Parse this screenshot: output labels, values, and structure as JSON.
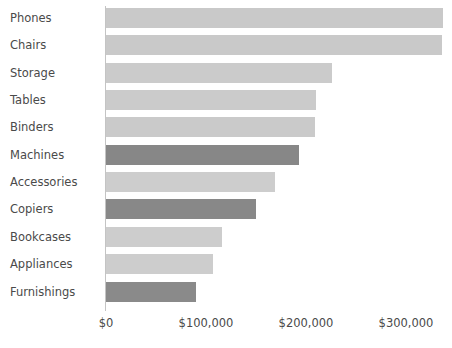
{
  "chart_data": {
    "type": "bar",
    "orientation": "horizontal",
    "title": "",
    "subtitle": "",
    "xlabel": "",
    "ylabel": "",
    "categories": [
      "Phones",
      "Chairs",
      "Storage",
      "Tables",
      "Binders",
      "Machines",
      "Accessories",
      "Copiers",
      "Bookcases",
      "Appliances",
      "Furnishings"
    ],
    "values": [
      337000,
      336000,
      226000,
      210000,
      209000,
      193000,
      169000,
      150000,
      116000,
      107000,
      90000
    ],
    "bar_colors": [
      "#c9c9c9",
      "#c9c9c9",
      "#cbcbcb",
      "#cbcbcb",
      "#cacaca",
      "#878787",
      "#cdcdcd",
      "#888888",
      "#cdcdcd",
      "#cdcdcd",
      "#8a8a8a"
    ],
    "xlim": [
      0,
      352000
    ],
    "xticks": [
      0,
      100000,
      200000,
      300000
    ],
    "xtick_labels": [
      "$0",
      "$100,000",
      "$200,000",
      "$300,000"
    ],
    "grid": false,
    "legend": null,
    "colors": {
      "bar_light": "#cacaca",
      "bar_dark": "#888888",
      "axis": "#c4c4c4",
      "text": "#4a4a4a",
      "background": "#ffffff"
    }
  },
  "axis": {
    "tick_labels": [
      "$0",
      "$100,000",
      "$200,000",
      "$300,000"
    ]
  },
  "rows": [
    {
      "label": "Phones",
      "value": 337000
    },
    {
      "label": "Chairs",
      "value": 336000
    },
    {
      "label": "Storage",
      "value": 226000
    },
    {
      "label": "Tables",
      "value": 210000
    },
    {
      "label": "Binders",
      "value": 209000
    },
    {
      "label": "Machines",
      "value": 193000
    },
    {
      "label": "Accessories",
      "value": 169000
    },
    {
      "label": "Copiers",
      "value": 150000
    },
    {
      "label": "Bookcases",
      "value": 116000
    },
    {
      "label": "Appliances",
      "value": 107000
    },
    {
      "label": "Furnishings",
      "value": 90000
    }
  ]
}
